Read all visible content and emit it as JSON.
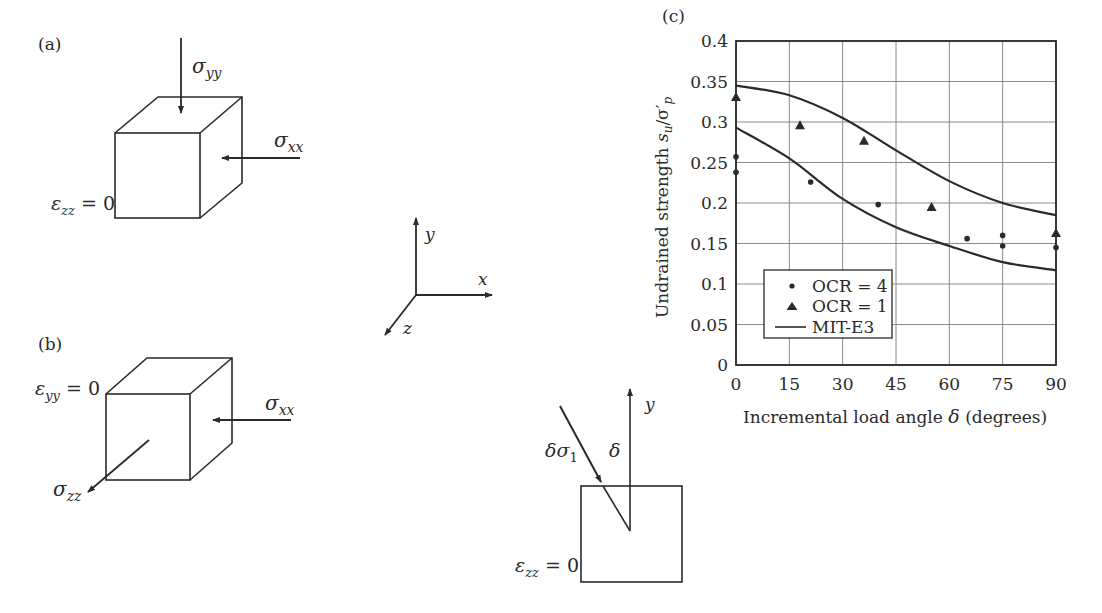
{
  "panels": {
    "a": {
      "label": "(a)",
      "sigma_top": "σ",
      "sigma_top_sub": "yy",
      "sigma_right": "σ",
      "sigma_right_sub": "xx",
      "strain": "ε",
      "strain_sub": "zz",
      "strain_value": " = 0"
    },
    "b": {
      "label": "(b)",
      "strain": "ε",
      "strain_sub": "yy",
      "strain_value": " = 0",
      "sigma_right": "σ",
      "sigma_right_sub": "xx",
      "sigma_out": "σ",
      "sigma_out_sub": "zz"
    },
    "axes": {
      "x": "x",
      "y": "y",
      "z": "z"
    },
    "d": {
      "load": "δσ",
      "load_sub": "1",
      "angle": "δ",
      "axis_y": "y",
      "strain": "ε",
      "strain_sub": "zz",
      "strain_value": " = 0"
    }
  },
  "chart_data": {
    "panel_label": "(c)",
    "type": "scatter",
    "title": "",
    "xlabel": "Incremental load angle δ (degrees)",
    "xlabel_main": "Incremental load angle ",
    "xlabel_symbol": "δ",
    "xlabel_unit": " (degrees)",
    "ylabel": "Undrained strength s_u/σ'_p",
    "ylabel_main": "Undrained strength ",
    "xlim": [
      0,
      90
    ],
    "ylim": [
      0,
      0.4
    ],
    "xticks": [
      "0",
      "15",
      "30",
      "45",
      "60",
      "75",
      "90"
    ],
    "yticks": [
      "0",
      "0.05",
      "0.1",
      "0.15",
      "0.2",
      "0.25",
      "0.3",
      "0.35",
      "0.4"
    ],
    "grid": true,
    "legend_position": "lower-left",
    "series": [
      {
        "name": "OCR = 4",
        "marker": "circle",
        "x": [
          0,
          0,
          21,
          40,
          65,
          75,
          75,
          90
        ],
        "y": [
          0.257,
          0.238,
          0.226,
          0.198,
          0.156,
          0.16,
          0.147,
          0.145
        ]
      },
      {
        "name": "OCR = 1",
        "marker": "triangle",
        "x": [
          0,
          18,
          36,
          55,
          90
        ],
        "y": [
          0.331,
          0.296,
          0.277,
          0.195,
          0.163
        ]
      },
      {
        "name": "MIT-E3",
        "marker": "line",
        "curves": [
          {
            "x": [
              0,
              15,
              30,
              45,
              60,
              75,
              90
            ],
            "y": [
              0.345,
              0.333,
              0.305,
              0.265,
              0.227,
              0.2,
              0.185
            ]
          },
          {
            "x": [
              0,
              15,
              30,
              45,
              60,
              75,
              90
            ],
            "y": [
              0.293,
              0.255,
              0.205,
              0.17,
              0.147,
              0.127,
              0.117
            ]
          }
        ]
      }
    ]
  }
}
